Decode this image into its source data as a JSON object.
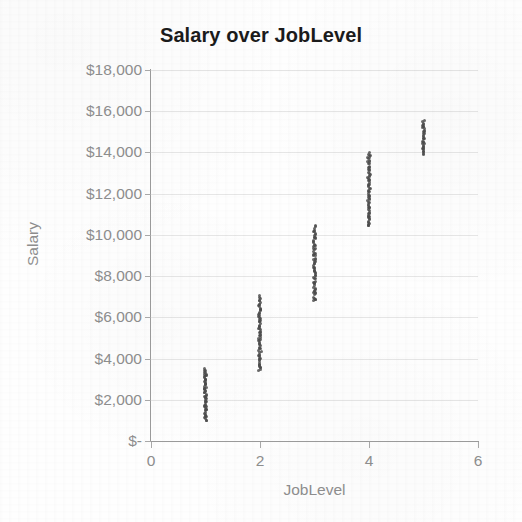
{
  "chart_data": {
    "type": "scatter",
    "title": "Salary over JobLevel",
    "xlabel": "JobLevel",
    "ylabel": "Salary",
    "xlim": [
      0,
      6
    ],
    "ylim": [
      0,
      18000
    ],
    "grid": true,
    "legend": false,
    "x_ticks": [
      "0",
      "2",
      "4",
      "6"
    ],
    "x_tick_values": [
      0,
      2,
      4,
      6
    ],
    "y_ticks": [
      "$-",
      "$2,000",
      "$4,000",
      "$6,000",
      "$8,000",
      "$10,000",
      "$12,000",
      "$14,000",
      "$16,000",
      "$18,000"
    ],
    "y_tick_values": [
      0,
      2000,
      4000,
      6000,
      8000,
      10000,
      12000,
      14000,
      16000,
      18000
    ],
    "point_color": "#4a4a4a",
    "series": [
      {
        "name": "Employees",
        "clusters": [
          {
            "x": 1,
            "y_min": 1000,
            "y_max": 3500,
            "n": 60
          },
          {
            "x": 2,
            "y_min": 3400,
            "y_max": 7000,
            "n": 70
          },
          {
            "x": 3,
            "y_min": 6800,
            "y_max": 10400,
            "n": 70
          },
          {
            "x": 4,
            "y_min": 10400,
            "y_max": 14000,
            "n": 70
          },
          {
            "x": 5,
            "y_min": 13900,
            "y_max": 15500,
            "n": 34
          }
        ]
      }
    ]
  }
}
